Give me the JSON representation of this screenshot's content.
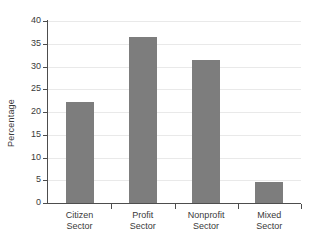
{
  "chart_data": {
    "type": "bar",
    "title": "",
    "xlabel": "",
    "ylabel": "Percentage",
    "categories": [
      "Citizen Sector",
      "Profit Sector",
      "Nonprofit Sector",
      "Mixed Sector"
    ],
    "category_lines": [
      [
        "Citizen",
        "Sector"
      ],
      [
        "Profit",
        "Sector"
      ],
      [
        "Nonprofit",
        "Sector"
      ],
      [
        "Mixed",
        "Sector"
      ]
    ],
    "values": [
      22.2,
      36.5,
      31.4,
      4.6
    ],
    "ylim": [
      0,
      40
    ],
    "yticks": [
      0,
      5,
      10,
      15,
      20,
      25,
      30,
      35,
      40
    ],
    "ytick_labels": [
      "0",
      "5",
      "10",
      "15",
      "20",
      "25",
      "30",
      "35",
      "40"
    ],
    "grid": "horizontal",
    "legend": "none",
    "bar_color": "#7d7d7d",
    "axis_color": "#4d4d4d",
    "gridline_color": "#e9e9e9",
    "background_color": "#ffffff"
  }
}
